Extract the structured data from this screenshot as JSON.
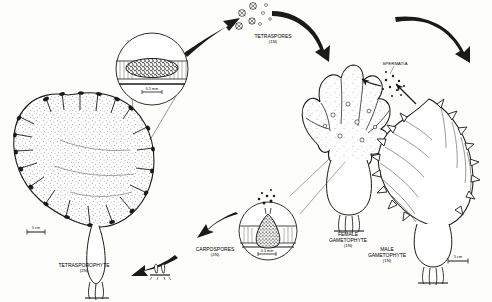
{
  "figure": {
    "ink_color": "#1a1a18",
    "paper_color": "#fdfdfc",
    "width": 492,
    "height": 302
  },
  "stages": {
    "tetrasporophyte": {
      "name": "TETRASPOROPHYTE",
      "ploidy": "(2N)",
      "scale_bar": "5 cm"
    },
    "tetraspores": {
      "name": "TETRASPORES",
      "ploidy": "(1N)"
    },
    "female_gametophyte": {
      "name_line1": "FEMALE",
      "name_line2": "GAMETOPHYTE",
      "ploidy": "(1N)"
    },
    "male_gametophyte": {
      "name_line1": "MALE",
      "name_line2": "GAMETOPHYTE",
      "ploidy": "(1N)",
      "scale_bar": "5 cm"
    },
    "spermatia": {
      "name": "SPERMATIA"
    },
    "carpospores": {
      "name": "CARPOSPORES",
      "ploidy": "(2N)"
    }
  },
  "insets": {
    "tetrasporangial_sorus": {
      "scale_bar": "0.5 mm"
    },
    "cystocarp": {
      "scale_bar": "0.5 mm"
    }
  }
}
